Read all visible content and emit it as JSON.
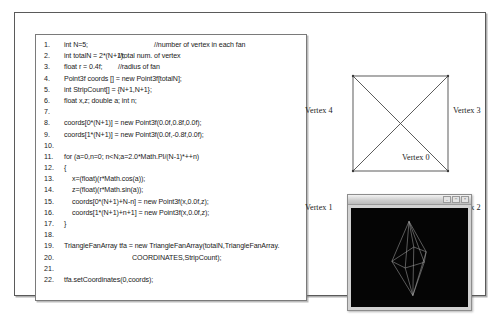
{
  "code_panel": {
    "name": "java3d-trianglefanarray-code",
    "lines": [
      {
        "n": "1.",
        "indent": 0,
        "text": "int N=5;",
        "comment": "//number of vertex in each fan",
        "comment_x": 118
      },
      {
        "n": "2.",
        "indent": 0,
        "text": "int totalN = 2*(N+1);",
        "comment": "//total num. of vertex",
        "comment_x": 82
      },
      {
        "n": "3.",
        "indent": 0,
        "text": "float r = 0.4f;",
        "comment": "//radius of fan",
        "comment_x": 82
      },
      {
        "n": "4.",
        "indent": 0,
        "text": "Point3f coords [] = new Point3f[totalN];",
        "comment": "",
        "comment_x": 0
      },
      {
        "n": "5.",
        "indent": 0,
        "text": "int StripCount[] = {N+1,N+1};",
        "comment": "",
        "comment_x": 0
      },
      {
        "n": "6.",
        "indent": 0,
        "text": "float x,z; double a;  int n;",
        "comment": "",
        "comment_x": 0
      },
      {
        "n": "7.",
        "indent": 0,
        "text": "",
        "comment": "",
        "comment_x": 0
      },
      {
        "n": "8.",
        "indent": 0,
        "text": "coords[0*(N+1)] = new Point3f(0.0f,0.8f,0.0f);",
        "comment": "",
        "comment_x": 0
      },
      {
        "n": "9.",
        "indent": 0,
        "text": "coords[1*(N+1)] = new Point3f(0.0f,-0.8f,0.0f);",
        "comment": "",
        "comment_x": 0
      },
      {
        "n": "10.",
        "indent": 0,
        "text": "",
        "comment": "",
        "comment_x": 0
      },
      {
        "n": "11.",
        "indent": 0,
        "text": "for (a=0,n=0; n<N;a=2.0*Math.PI/(N-1)*++n)",
        "comment": "",
        "comment_x": 0
      },
      {
        "n": "12.",
        "indent": 0,
        "text": "{",
        "comment": "",
        "comment_x": 0
      },
      {
        "n": "13.",
        "indent": 1,
        "text": "x=(float)(r*Math.cos(a));",
        "comment": "",
        "comment_x": 0
      },
      {
        "n": "14.",
        "indent": 1,
        "text": "z=(float)(r*Math.sin(a));",
        "comment": "",
        "comment_x": 0
      },
      {
        "n": "15.",
        "indent": 1,
        "text": "coords[0*(N+1)+N-n] = new Point3f(x,0.0f,z);",
        "comment": "",
        "comment_x": 0
      },
      {
        "n": "16.",
        "indent": 1,
        "text": "coords[1*(N+1)+n+1] = new Point3f(x,0.0f,z);",
        "comment": "",
        "comment_x": 0
      },
      {
        "n": "17.",
        "indent": 0,
        "text": "}",
        "comment": "",
        "comment_x": 0
      },
      {
        "n": "18.",
        "indent": 0,
        "text": "",
        "comment": "",
        "comment_x": 0
      },
      {
        "n": "19.",
        "indent": 0,
        "text": "TriangleFanArray tfa = new TriangleFanArray(totalN,TriangleFanArray.",
        "comment": "",
        "comment_x": 0
      },
      {
        "n": "20.",
        "indent": 2,
        "text": "COORDINATES,StripCount);",
        "comment": "",
        "comment_x": 0
      },
      {
        "n": "21.",
        "indent": 0,
        "text": "",
        "comment": "",
        "comment_x": 0
      },
      {
        "n": "22.",
        "indent": 0,
        "text": "tfa.setCoordinates(0,coords);",
        "comment": "",
        "comment_x": 0
      }
    ]
  },
  "fan_diagram": {
    "title": "triangle-fan-vertex-order",
    "labels": {
      "v0": "Vertex 0",
      "v1": "Vertex 1",
      "v2": "Vertex 2",
      "v3": "Vertex 3",
      "v4": "Vertex 4"
    },
    "line_color": "#4a4a4a"
  },
  "render_window": {
    "title": "",
    "minimize": "_",
    "maximize": "□",
    "close": "×",
    "canvas_bg": "#050505",
    "wire_color": "#b9b9b9"
  }
}
